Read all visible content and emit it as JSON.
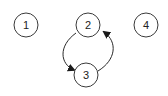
{
  "diagram": {
    "type": "directed-graph",
    "nodes": [
      {
        "id": "1",
        "label": "1",
        "cx": 26,
        "cy": 25,
        "r": 12
      },
      {
        "id": "2",
        "label": "2",
        "cx": 88,
        "cy": 25,
        "r": 12
      },
      {
        "id": "3",
        "label": "3",
        "cx": 86,
        "cy": 75,
        "r": 12
      },
      {
        "id": "4",
        "label": "4",
        "cx": 146,
        "cy": 25,
        "r": 12
      }
    ],
    "edges": [
      {
        "from": "2",
        "to": "3"
      },
      {
        "from": "3",
        "to": "2"
      }
    ],
    "colors": {
      "stroke": "#3a3a3a",
      "text": "#222222",
      "background": "#ffffff"
    }
  }
}
